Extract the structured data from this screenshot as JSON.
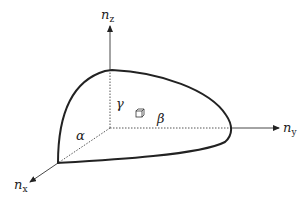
{
  "diagram": {
    "axes": {
      "z": {
        "base": "n",
        "sub": "z"
      },
      "y": {
        "base": "n",
        "sub": "y"
      },
      "x": {
        "base": "n",
        "sub": "x"
      }
    },
    "region_labels": {
      "alpha": "α",
      "beta": "β",
      "gamma": "γ"
    },
    "volume_element_icon": "small-cube",
    "colors": {
      "line": "#222222",
      "background": "#ffffff"
    }
  }
}
